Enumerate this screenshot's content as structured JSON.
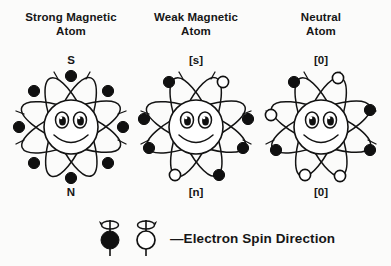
{
  "figure": {
    "title_absent": true,
    "background_color": "#fbfbfa",
    "ink_color": "#121212"
  },
  "columns": [
    {
      "id": "strong-magnetic-atom",
      "title": "Strong Magnetic\nAtom",
      "title_line1": "Strong Magnetic",
      "title_line2": "Atom",
      "pole_top": "S",
      "pole_bottom": "N",
      "electrons": [
        {
          "pos": "top",
          "spin": "black"
        },
        {
          "pos": "top-left",
          "spin": "black"
        },
        {
          "pos": "left",
          "spin": "black"
        },
        {
          "pos": "bottom-left",
          "spin": "black"
        },
        {
          "pos": "bottom",
          "spin": "black"
        },
        {
          "pos": "bottom-right",
          "spin": "black"
        },
        {
          "pos": "right",
          "spin": "black"
        },
        {
          "pos": "top-right",
          "spin": "black"
        }
      ],
      "black_count": 8,
      "white_count": 0,
      "face": "smiling"
    },
    {
      "id": "weak-magnetic-atom",
      "title": "Weak Magnetic\nAtom",
      "title_line1": "Weak Magnetic",
      "title_line2": "Atom",
      "pole_top": "[s]",
      "pole_bottom": "[n]",
      "electrons": [
        {
          "pos": "top-left",
          "spin": "black"
        },
        {
          "pos": "top-right",
          "spin": "white"
        },
        {
          "pos": "left",
          "spin": "black"
        },
        {
          "pos": "right",
          "spin": "black"
        },
        {
          "pos": "lower-left",
          "spin": "black"
        },
        {
          "pos": "lower-right",
          "spin": "black"
        },
        {
          "pos": "bottom-left",
          "spin": "white"
        },
        {
          "pos": "bottom-right",
          "spin": "black"
        }
      ],
      "black_count": 6,
      "white_count": 2,
      "face": "smiling"
    },
    {
      "id": "neutral-atom",
      "title": "Neutral\nAtom",
      "title_line1": "Neutral",
      "title_line2": "Atom",
      "pole_top": "[0]",
      "pole_bottom": "[0]",
      "electrons": [
        {
          "pos": "top-left",
          "spin": "black"
        },
        {
          "pos": "top-right",
          "spin": "white"
        },
        {
          "pos": "left",
          "spin": "white"
        },
        {
          "pos": "right",
          "spin": "black"
        },
        {
          "pos": "lower-left",
          "spin": "black"
        },
        {
          "pos": "lower-right",
          "spin": "black"
        },
        {
          "pos": "bottom-left",
          "spin": "white"
        },
        {
          "pos": "bottom-right",
          "spin": "white"
        }
      ],
      "black_count": 4,
      "white_count": 4,
      "face": "smiling"
    }
  ],
  "legend": {
    "symbol_black": "filled-sphere-spin-symbol",
    "symbol_white": "open-sphere-spin-symbol",
    "text": "—Electron Spin Direction"
  }
}
